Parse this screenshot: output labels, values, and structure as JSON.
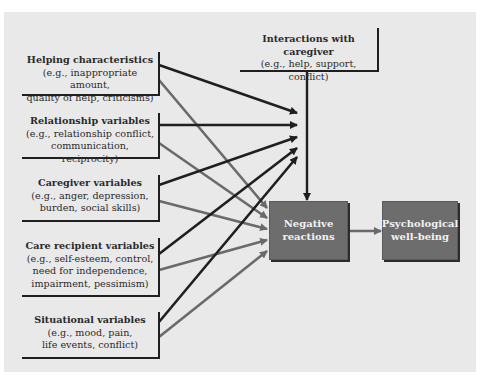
{
  "diagram": {
    "colors": {
      "background_panel": "#e9e9e9",
      "black_arrow": "#1f1f1f",
      "gray_arrow": "#6a6a6a",
      "dark_box": "#6d6d6d",
      "dark_box_text": "#f2f2f2"
    },
    "predictors": [
      {
        "title": "Helping characteristics",
        "lines": [
          "(e.g., inappropriate amount,",
          "quality of help, criticisms)"
        ]
      },
      {
        "title": "Relationship variables",
        "lines": [
          "(e.g., relationship conflict,",
          "communication, reciprocity)"
        ]
      },
      {
        "title": "Caregiver variables",
        "lines": [
          "(e.g., anger, depression,",
          "burden, social skills)"
        ]
      },
      {
        "title": "Care recipient variables",
        "lines": [
          "(e.g., self-esteem, control,",
          "need for independence,",
          "impairment, pessimism)"
        ]
      },
      {
        "title": "Situational variables",
        "lines": [
          "(e.g., mood, pain,",
          "life events, conflict)"
        ]
      }
    ],
    "interactions": {
      "title": "Interactions with caregiver",
      "lines": [
        "(e.g., help, support, conflict)"
      ]
    },
    "mediator": {
      "line1": "Negative",
      "line2": "reactions"
    },
    "outcome": {
      "line1": "Psychological",
      "line2": "well-being"
    },
    "edges": [
      "Each predictor → Interactions with caregiver (black)",
      "Each predictor → Negative reactions (gray)",
      "Interactions with caregiver → Negative reactions",
      "Negative reactions → Psychological well-being"
    ]
  }
}
